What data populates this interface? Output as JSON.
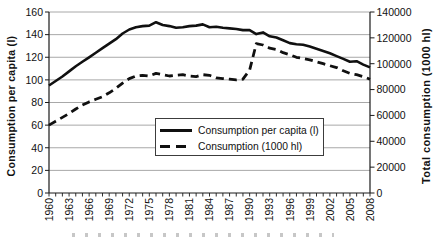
{
  "chart_data": {
    "type": "line",
    "title": "",
    "x_years": [
      1960,
      1961,
      1962,
      1963,
      1964,
      1965,
      1966,
      1967,
      1968,
      1969,
      1970,
      1971,
      1972,
      1973,
      1974,
      1975,
      1976,
      1977,
      1978,
      1979,
      1980,
      1981,
      1982,
      1983,
      1984,
      1985,
      1986,
      1987,
      1988,
      1989,
      1990,
      1991,
      1992,
      1993,
      1994,
      1995,
      1996,
      1997,
      1998,
      1999,
      2000,
      2001,
      2002,
      2003,
      2004,
      2005,
      2006,
      2007,
      2008
    ],
    "x_label_every": 3,
    "series": [
      {
        "name": "Consumption per capita (l)",
        "axis": "left",
        "line_style": "solid",
        "values": [
          95,
          99,
          103,
          107.5,
          112,
          116,
          120,
          124,
          128,
          132,
          136,
          141,
          144.5,
          146.5,
          147.5,
          148,
          151,
          148.5,
          147.5,
          146,
          146.5,
          147.5,
          148,
          149,
          146.5,
          147,
          146,
          145.5,
          145,
          144,
          144,
          140.5,
          142,
          138.5,
          137.5,
          135,
          132.5,
          131.5,
          131,
          129.5,
          127.5,
          125.5,
          123.5,
          121,
          118.5,
          116,
          116.5,
          113.5,
          111
        ]
      },
      {
        "name": "Consumption (1000 hl)",
        "axis": "right",
        "line_style": "dashed",
        "values": [
          52500,
          55500,
          58500,
          61500,
          65000,
          68000,
          70500,
          72500,
          74500,
          77500,
          81000,
          85000,
          88500,
          90500,
          91000,
          90500,
          92500,
          91500,
          90500,
          91000,
          91500,
          90500,
          90000,
          91500,
          91000,
          89000,
          88500,
          88000,
          87500,
          88000,
          95000,
          115500,
          114500,
          112000,
          111000,
          108500,
          107000,
          105000,
          104000,
          103000,
          101500,
          100000,
          98500,
          97000,
          94500,
          92500,
          91500,
          90000,
          88000
        ]
      }
    ],
    "left_axis": {
      "title": "Consumption per capita (l)",
      "min": 0,
      "max": 160,
      "step": 20
    },
    "right_axis": {
      "title": "Total consumption (1000 hl)",
      "min": 0,
      "max": 140000,
      "step": 20000
    },
    "legend": {
      "position": "center-middle",
      "entries": [
        "Consumption per capita (l)",
        "Consumption (1000 hl)"
      ]
    },
    "grid": "horizontal",
    "colors": {
      "line": "#101010",
      "grid": "#a8a8a8",
      "axis": "#1a1a1a",
      "text": "#111111",
      "background": "#ffffff"
    }
  }
}
